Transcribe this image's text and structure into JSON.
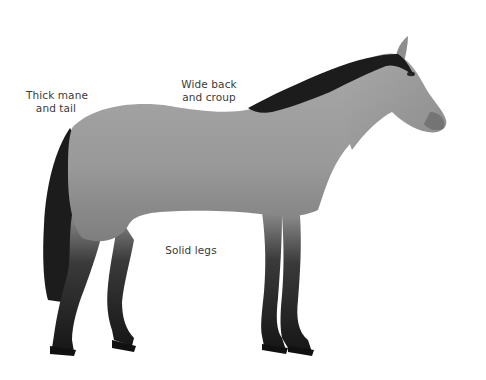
{
  "diagram": {
    "colors": {
      "background": "#ffffff",
      "coat": "#9a9a9a",
      "coat_light": "#b4b4b4",
      "points_dark": "#1c1c1c",
      "label_text": "#3a3a3a"
    },
    "labels": [
      {
        "id": "mane-tail",
        "lines": [
          "Thick mane",
          "and tail"
        ]
      },
      {
        "id": "back-croup",
        "lines": [
          "Wide back",
          "and croup"
        ]
      },
      {
        "id": "legs",
        "lines": [
          "Solid legs"
        ]
      }
    ]
  }
}
